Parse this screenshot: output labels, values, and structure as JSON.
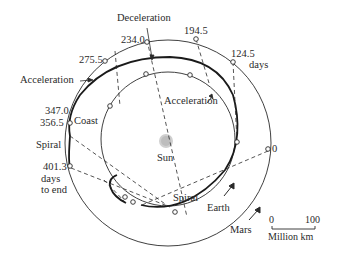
{
  "diagram": {
    "title": "",
    "bodies": {
      "sun": "Sun",
      "earth": "Earth",
      "mars": "Mars"
    },
    "phases": {
      "deceleration": "Deceleration",
      "acceleration_left": "Acceleration",
      "acceleration_right": "Acceleration",
      "coast": "Coast",
      "spiral_left": "Spiral",
      "spiral_bottom": "Spiral"
    },
    "time_markers": {
      "t0": "0",
      "t124": "124.5",
      "t124_unit": "days",
      "t194": "194.5",
      "t234": "234.0",
      "t275": "275.5",
      "t347": "347.0",
      "t356": "356.5",
      "t401": "401.3",
      "t401_unit1": "days",
      "t401_unit2": "to end"
    },
    "scale_bar": {
      "start": "0",
      "end": "100",
      "unit": "Million km"
    },
    "colors": {
      "line": "#2a2a2a",
      "sun": "#c8c8c8",
      "background": "#ffffff"
    }
  }
}
